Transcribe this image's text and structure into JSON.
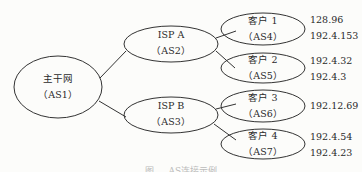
{
  "diagram": {
    "root": {
      "name": "主干网",
      "as": "（AS1）"
    },
    "isps": [
      {
        "name": "ISP A",
        "as": "（AS2）"
      },
      {
        "name": "ISP B",
        "as": "（AS3）"
      }
    ],
    "customers": [
      {
        "name": "客户 1",
        "as": "（AS4）",
        "ips": [
          "128.96",
          "192.4.153"
        ]
      },
      {
        "name": "客户 2",
        "as": "（AS5）",
        "ips": [
          "192.4.32",
          "192.4.3"
        ]
      },
      {
        "name": "客户 3",
        "as": "（AS6）",
        "ips": [
          "192.12.69"
        ]
      },
      {
        "name": "客户 4",
        "as": "（AS7）",
        "ips": [
          "192.4.54",
          "192.4.23"
        ]
      }
    ],
    "caption": "图 … AS连接示例"
  }
}
